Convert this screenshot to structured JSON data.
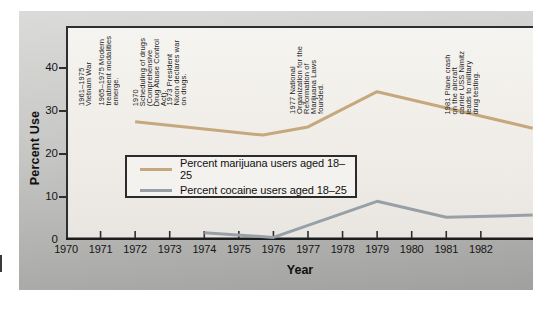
{
  "chart_data": {
    "type": "line",
    "title": "",
    "xlabel": "Year",
    "ylabel": "Percent Use",
    "xlim": [
      1970,
      1983.5
    ],
    "ylim": [
      0,
      49.8
    ],
    "x_ticks": [
      1970,
      1971,
      1972,
      1973,
      1974,
      1975,
      1976,
      1977,
      1978,
      1979,
      1980,
      1981,
      1982
    ],
    "y_ticks": [
      0,
      10,
      20,
      30,
      40
    ],
    "grid": false,
    "legend_position": "inside-left-middle",
    "series": [
      {
        "name": "Percent marijuana users aged 18–25",
        "color": "#c6a87e",
        "points": [
          [
            1972,
            27.5
          ],
          [
            1974,
            25.8
          ],
          [
            1975.7,
            24.4
          ],
          [
            1977,
            26.3
          ],
          [
            1979,
            34.5
          ],
          [
            1983.5,
            26
          ]
        ]
      },
      {
        "name": "Percent cocaine users aged 18–25",
        "color": "#97a0a6",
        "points": [
          [
            1974,
            1.7
          ],
          [
            1976,
            0.6
          ],
          [
            1979,
            9
          ],
          [
            1981,
            5.3
          ],
          [
            1983.5,
            5.8
          ]
        ]
      }
    ],
    "annotations": [
      {
        "x": 12,
        "bottom": 134,
        "text": "1961–1975\nVietnam War"
      },
      {
        "x": 32,
        "bottom": 134,
        "text": "1965–1975 Modern\ntreatment modalities\nemerge."
      },
      {
        "x": 66,
        "bottom": 134,
        "text": "1970\nScheduling of drugs\n(Comprehensive\nDrug Abuse Control\nAct)."
      },
      {
        "x": 100,
        "bottom": 134,
        "text": "1973 President\nNixon declares war\non drugs."
      },
      {
        "x": 223,
        "bottom": 126,
        "text": "1977 National\nOrganization for the\nReformation of\nMarijuana Laws\nfounded."
      },
      {
        "x": 378,
        "bottom": 126,
        "text": "1981 Plane crash\non the aircraft\ncarrier USS Nimitz\nleads to military\ndrug testing."
      }
    ]
  }
}
